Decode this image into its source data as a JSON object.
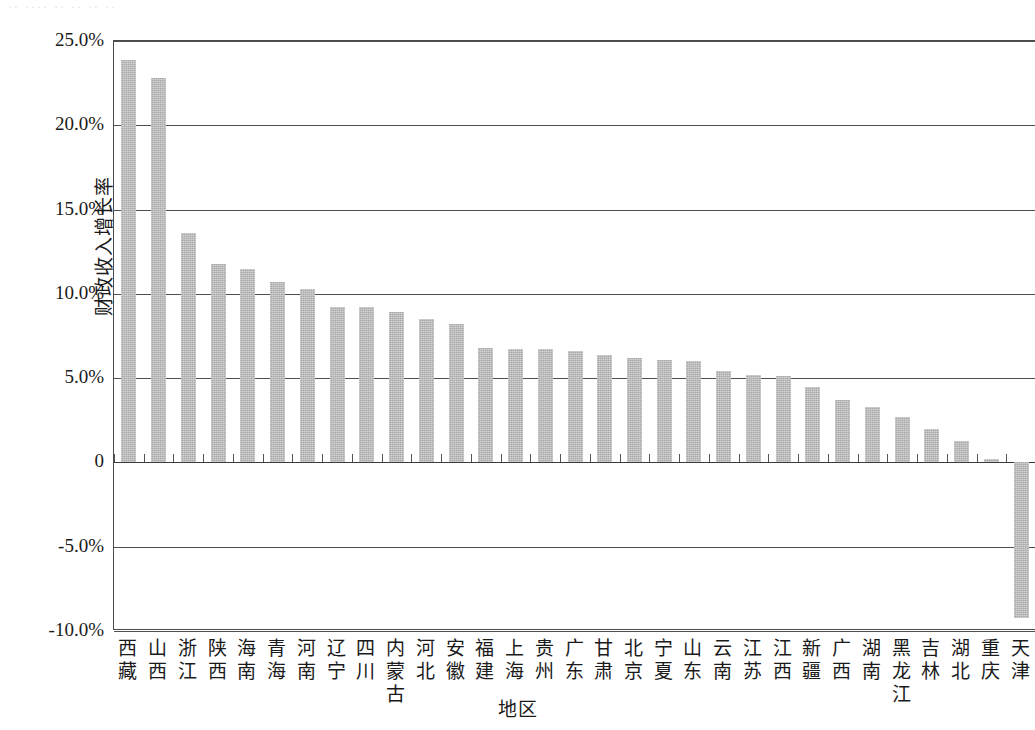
{
  "scan_artifact_text": "·· ···· ·· ·· ·· ··",
  "chart_data": {
    "type": "bar",
    "title": "",
    "xlabel": "地区",
    "ylabel": "财政收入增长率",
    "ylim": [
      -10,
      25
    ],
    "ytick_labels": [
      "25.0%",
      "20.0%",
      "15.0%",
      "10.0%",
      "5.0%",
      "0",
      "-5.0%",
      "-10.0%"
    ],
    "ytick_values": [
      25,
      20,
      15,
      10,
      5,
      0,
      -5,
      -10
    ],
    "grid": true,
    "legend": "none",
    "bar_color": "#a9a9a9",
    "categories": [
      "西藏",
      "山西",
      "浙江",
      "陕西",
      "海南",
      "青海",
      "河南",
      "辽宁",
      "四川",
      "内蒙古",
      "河北",
      "安徽",
      "福建",
      "上海",
      "贵州",
      "广东",
      "甘肃",
      "北京",
      "宁夏",
      "山东",
      "云南",
      "江苏",
      "江西",
      "新疆",
      "广西",
      "湖南",
      "黑龙江",
      "吉林",
      "湖北",
      "重庆",
      "天津"
    ],
    "values": [
      23.9,
      22.8,
      13.6,
      11.8,
      11.5,
      10.7,
      10.3,
      9.2,
      9.2,
      8.9,
      8.5,
      8.2,
      6.8,
      6.7,
      6.7,
      6.6,
      6.4,
      6.2,
      6.1,
      6.0,
      5.4,
      5.2,
      5.1,
      4.5,
      3.7,
      3.3,
      2.7,
      2.0,
      1.3,
      0.2,
      -9.2
    ],
    "units": "percent"
  }
}
